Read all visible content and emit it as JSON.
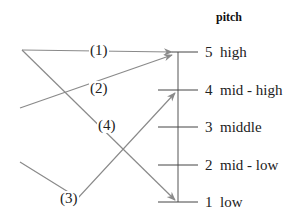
{
  "title": "pitch",
  "scale": {
    "levels": [
      {
        "number": "5",
        "name": "high"
      },
      {
        "number": "4",
        "name": "mid - high"
      },
      {
        "number": "3",
        "name": "middle"
      },
      {
        "number": "2",
        "name": "mid - low"
      },
      {
        "number": "1",
        "name": "low"
      }
    ]
  },
  "contours": [
    {
      "label": "(1)",
      "from": "start",
      "to": "5 high",
      "shape": "level high"
    },
    {
      "label": "(2)",
      "from": "start",
      "to": "5 high",
      "shape": "rising"
    },
    {
      "label": "(3)",
      "from": "start",
      "via": "low dip",
      "to": "4 mid - high",
      "shape": "falling-rising"
    },
    {
      "label": "(4)",
      "from": "start (high)",
      "to": "1 low",
      "shape": "falling"
    }
  ],
  "colors": {
    "contour_line": "#8a8a8a",
    "scale_line": "#444444",
    "text": "#222222"
  }
}
